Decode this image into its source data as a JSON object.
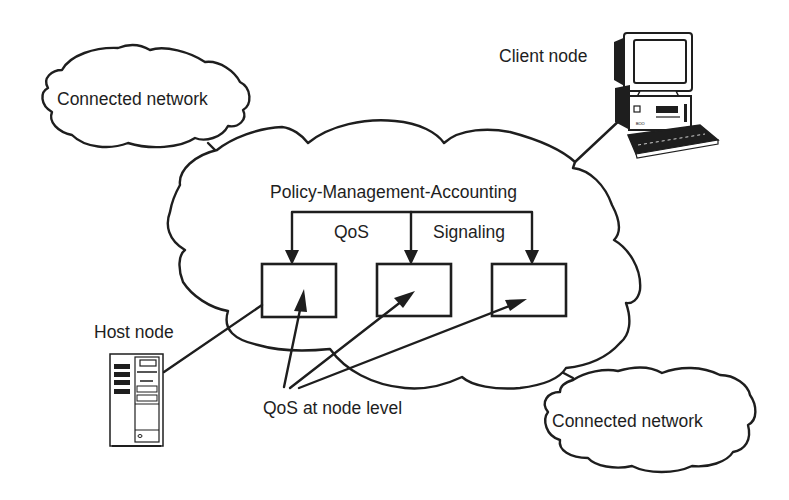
{
  "diagram": {
    "title": "",
    "clouds": {
      "connected_network_top_left": {
        "label": "Connected network"
      },
      "connected_network_bottom_right": {
        "label": "Connected network"
      },
      "main_network": {
        "header_label": "Policy-Management-Accounting",
        "branch_labels": [
          "QoS",
          "Signaling"
        ],
        "node_boxes": 3
      }
    },
    "nodes": {
      "client": {
        "label": "Client node",
        "icon": "desktop-computer-icon"
      },
      "host": {
        "label": "Host node",
        "icon": "server-tower-icon"
      }
    },
    "annotation": {
      "label": "QoS at node level"
    },
    "colors": {
      "ink": "#1e1e1e",
      "background": "#ffffff"
    }
  }
}
